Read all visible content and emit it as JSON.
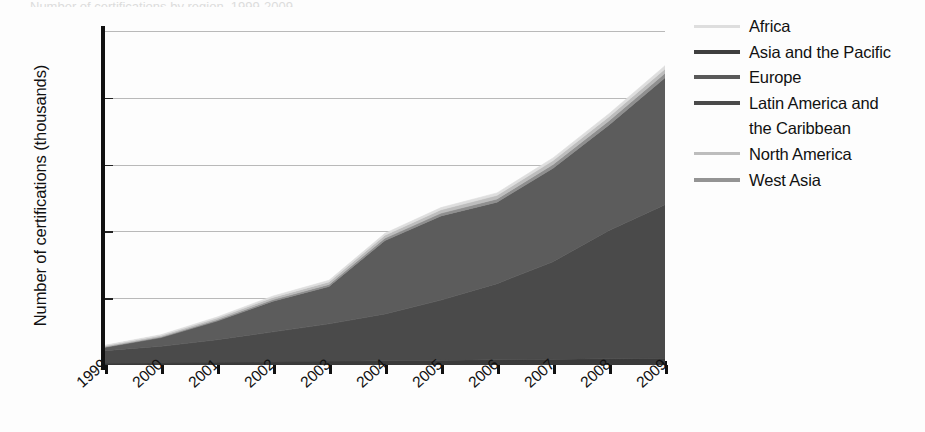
{
  "title_sliver": "Number of certifications by region, 1999-2009",
  "chart_data": {
    "type": "area",
    "stacked": true,
    "title": "",
    "xlabel": "",
    "ylabel": "Number of certifications (thousands)",
    "ylim": [
      0,
      250
    ],
    "yticks": [
      0,
      50,
      100,
      150,
      200,
      250
    ],
    "grid": true,
    "legend_position": "right",
    "categories": [
      "1999",
      "2000",
      "2001",
      "2002",
      "2003",
      "2004",
      "2005",
      "2006",
      "2007",
      "2008",
      "2009"
    ],
    "x": [
      1999,
      2000,
      2001,
      2002,
      2003,
      2004,
      2005,
      2006,
      2007,
      2008,
      2009
    ],
    "series": [
      {
        "name": "Latin America and the Caribbean",
        "color": "#3a3a3a",
        "values": [
          1.2,
          1.5,
          1.9,
          2.3,
          2.8,
          3.2,
          3.6,
          3.9,
          4.3,
          4.7,
          5.0
        ]
      },
      {
        "name": "Asia and the Pacific",
        "color": "#4a4a4a",
        "values": [
          9.5,
          12.5,
          17.0,
          22.5,
          28.0,
          35.0,
          45.0,
          57.0,
          73.0,
          96.0,
          115.0
        ]
      },
      {
        "name": "Europe",
        "color": "#5c5c5c",
        "values": [
          2.5,
          6.5,
          14.0,
          23.0,
          28.0,
          55.0,
          63.0,
          61.0,
          70.0,
          79.0,
          95.0
        ]
      },
      {
        "name": "West Asia",
        "color": "#8f8f8f",
        "values": [
          0.4,
          0.6,
          0.9,
          1.2,
          1.5,
          1.8,
          2.1,
          2.4,
          2.8,
          3.1,
          3.4
        ]
      },
      {
        "name": "North America",
        "color": "#bdbdbd",
        "values": [
          0.8,
          1.0,
          1.3,
          1.6,
          1.9,
          2.2,
          2.5,
          2.7,
          2.9,
          3.1,
          3.2
        ]
      },
      {
        "name": "Africa",
        "color": "#dedede",
        "values": [
          0.4,
          0.6,
          0.8,
          1.0,
          1.2,
          1.4,
          1.6,
          1.8,
          2.0,
          2.2,
          2.4
        ]
      }
    ],
    "totals": [
      14.8,
      22.7,
      35.9,
      51.6,
      63.4,
      98.6,
      117.8,
      128.8,
      155.0,
      188.1,
      224.0
    ]
  },
  "yaxis": {
    "title": "Number of certifications (thousands)",
    "ticks": [
      "0",
      "50",
      "100",
      "150",
      "200",
      "250"
    ]
  },
  "xaxis": {
    "ticks": [
      "1999",
      "2000",
      "2001",
      "2002",
      "2003",
      "2004",
      "2005",
      "2006",
      "2007",
      "2008",
      "2009"
    ]
  },
  "legend": {
    "items": [
      {
        "label": "Africa",
        "color": "#dedede",
        "continuation": ""
      },
      {
        "label": "Asia and the Pacific",
        "color": "#3f3f3f",
        "continuation": ""
      },
      {
        "label": "Europe",
        "color": "#595959",
        "continuation": ""
      },
      {
        "label": "Latin America and",
        "color": "#4a4a4a",
        "continuation": "the Caribbean"
      },
      {
        "label": "North America",
        "color": "#bdbdbd",
        "continuation": ""
      },
      {
        "label": "West Asia",
        "color": "#949494",
        "continuation": ""
      }
    ]
  }
}
